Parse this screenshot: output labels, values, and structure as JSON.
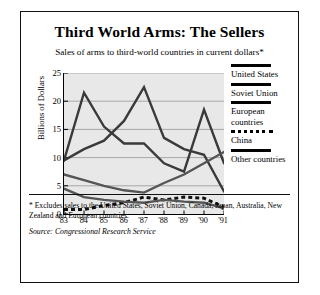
{
  "title": "Third World Arms: The Sellers",
  "subtitle": "Sales of arms to third-world countries in current dollars*",
  "footnote": "* Excludes sales to the United States, Soviet Union, Canada, Japan, Australia, New Zealand and European countries.",
  "source": "Source: Congressional Research Service",
  "legend": [
    {
      "label": "United States",
      "style": "solid"
    },
    {
      "label": "Soviet Union",
      "style": "solid"
    },
    {
      "label": "European countries",
      "style": "solid"
    },
    {
      "label": "China",
      "style": "dashed"
    },
    {
      "label": "Other countries",
      "style": "solid"
    }
  ],
  "chart_data": {
    "type": "line",
    "title": "Third World Arms: The Sellers",
    "subtitle": "Sales of arms to third-world countries in current dollars*",
    "xlabel": "",
    "ylabel": "Billions of Dollars",
    "categories": [
      "'83",
      "'84",
      "'85",
      "'86",
      "'87",
      "'88",
      "'89",
      "'90",
      "'91"
    ],
    "ylim": [
      0,
      25
    ],
    "yticks": [
      0,
      5,
      10,
      15,
      20,
      25
    ],
    "grid": true,
    "legend_position": "right",
    "series": [
      {
        "name": "United States",
        "style": "solid",
        "color": "#3a3a3a",
        "values": [
          9.5,
          21.5,
          15.5,
          12.5,
          12.5,
          9.0,
          7.5,
          18.5,
          9.0
        ]
      },
      {
        "name": "Soviet Union",
        "style": "solid",
        "color": "#3a3a3a",
        "values": [
          9.5,
          11.5,
          13.0,
          16.5,
          22.5,
          13.5,
          11.5,
          10.5,
          4.0
        ]
      },
      {
        "name": "European countries",
        "style": "solid",
        "color": "#555555",
        "values": [
          7.0,
          6.0,
          5.0,
          4.2,
          3.8,
          5.5,
          7.0,
          9.0,
          11.0
        ]
      },
      {
        "name": "China",
        "style": "dashed",
        "color": "#111111",
        "values": [
          0.8,
          0.8,
          1.5,
          2.0,
          3.0,
          2.5,
          3.0,
          2.8,
          1.2
        ]
      },
      {
        "name": "Other countries",
        "style": "solid",
        "color": "#555555",
        "values": [
          4.5,
          3.0,
          2.5,
          2.2,
          2.0,
          2.5,
          2.2,
          2.0,
          1.0
        ]
      }
    ]
  }
}
